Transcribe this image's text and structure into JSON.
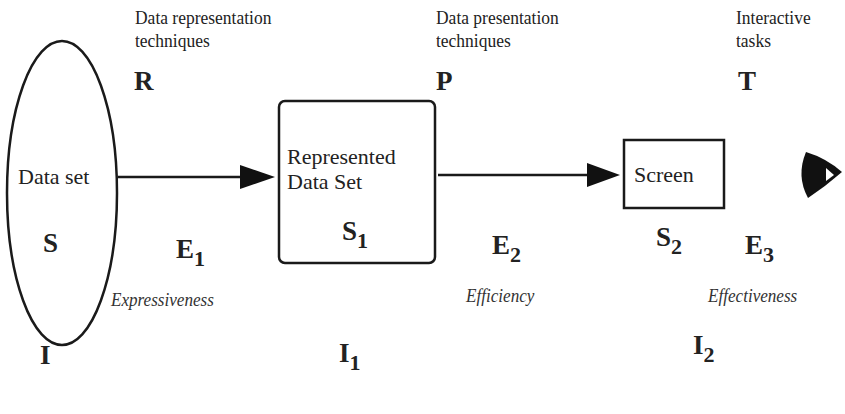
{
  "stages": {
    "representation": {
      "caption_line1": "Data representation",
      "caption_line2": "techniques",
      "symbol": "R"
    },
    "presentation": {
      "caption_line1": "Data presentation",
      "caption_line2": "techniques",
      "symbol": "P"
    },
    "tasks": {
      "caption_line1": "Interactive",
      "caption_line2": "tasks",
      "symbol": "T"
    }
  },
  "nodes": {
    "data_set": {
      "label": "Data set",
      "symbol": "S",
      "info": "I"
    },
    "represented": {
      "label_line1": "Represented",
      "label_line2": "Data Set",
      "symbol": "S",
      "symbol_sub": "1",
      "info": "I",
      "info_sub": "1"
    },
    "screen": {
      "label": "Screen",
      "symbol": "S",
      "symbol_sub": "2",
      "info": "I",
      "info_sub": "2"
    },
    "viewer": {
      "icon": "eye-icon"
    }
  },
  "evaluations": {
    "e1": {
      "symbol": "E",
      "sub": "1",
      "criterion": "Expressiveness"
    },
    "e2": {
      "symbol": "E",
      "sub": "2",
      "criterion": "Efficiency"
    },
    "e3": {
      "symbol": "E",
      "sub": "3",
      "criterion": "Effectiveness"
    }
  }
}
